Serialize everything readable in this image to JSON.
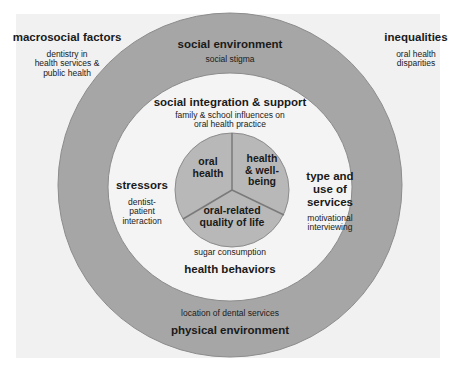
{
  "colors": {
    "outer_ring": "#a6a6a6",
    "outer_ring_stroke": "#8c8c8c",
    "middle_disk": "#f4f4f4",
    "inner_pie": "#b8b8b8",
    "pie_lines": "#7a7a7a",
    "background_panel": "#f1f1f1"
  },
  "corners": {
    "top_left": {
      "heading": "macrosocial factors",
      "sub": [
        "dentistry in",
        "health services &",
        "public health"
      ]
    },
    "top_right": {
      "heading": "inequalities",
      "sub": [
        "oral health",
        "disparities"
      ]
    }
  },
  "outer_ring": {
    "top": {
      "heading": "social environment",
      "sub": "social stigma"
    },
    "bottom": {
      "heading": "physical environment",
      "sub": "location of dental services"
    }
  },
  "middle_ring": {
    "top": {
      "heading": "social integration & support",
      "sub": [
        "family & school influences on",
        "oral health practice"
      ]
    },
    "left": {
      "heading": "stressors",
      "sub": [
        "dentist-",
        "patient",
        "interaction"
      ]
    },
    "right": {
      "heading": [
        "type and",
        "use of",
        "services"
      ],
      "sub": [
        "motivational",
        "interviewing"
      ]
    },
    "bottom": {
      "heading": "health behaviors",
      "sub": "sugar consumption"
    }
  },
  "inner_pie": {
    "segments": [
      {
        "label": [
          "oral",
          "health"
        ]
      },
      {
        "label": [
          "health",
          "& well-",
          "being"
        ]
      },
      {
        "label": [
          "oral-related",
          "quality of life"
        ]
      }
    ]
  }
}
